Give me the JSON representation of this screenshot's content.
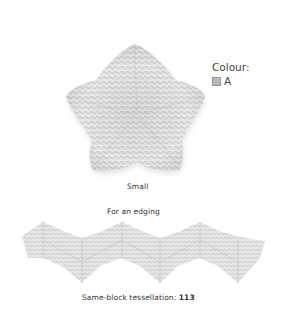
{
  "legend": {
    "title": "Colour:",
    "items": [
      {
        "key": "A",
        "color": "#b8b8b8"
      }
    ]
  },
  "star": {
    "caption": "Small",
    "fill": "#e6e6e6",
    "stitch": "#c9c9c9"
  },
  "edging": {
    "heading": "For an edging",
    "caption_prefix": "Same-block tessellation: ",
    "caption_number": "113",
    "fill": "#e4e4e4",
    "stitch": "#c6c6c6"
  }
}
